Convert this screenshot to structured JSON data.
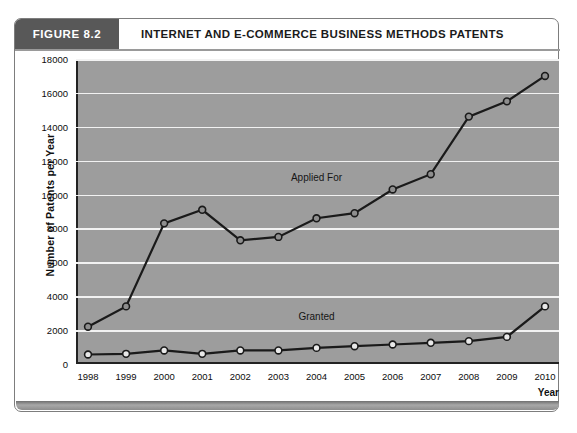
{
  "figure": {
    "tag": "FIGURE 8.2",
    "title": "INTERNET AND E-COMMERCE BUSINESS METHODS PATENTS"
  },
  "chart_data": {
    "type": "line",
    "title": "INTERNET AND E-COMMERCE BUSINESS METHODS PATENTS",
    "xlabel": "Year",
    "ylabel": "Number of Patents per Year",
    "categories": [
      "1998",
      "1999",
      "2000",
      "2001",
      "2002",
      "2003",
      "2004",
      "2005",
      "2006",
      "2007",
      "2008",
      "2009",
      "2010"
    ],
    "xlim": [
      1998,
      2010
    ],
    "ylim": [
      0,
      18000
    ],
    "yticks": [
      0,
      2000,
      4000,
      6000,
      8000,
      10000,
      12000,
      14000,
      16000,
      18000
    ],
    "ytick_labels": [
      "0",
      "2000",
      "4000",
      "6000",
      "8000",
      "10000",
      "12000",
      "14000",
      "16000",
      "18000"
    ],
    "grid": true,
    "legend": "inline-annotations",
    "plot_background": "#9d9d9d",
    "gridline_color": "#f2f2f2",
    "line_color": "#1a1a1a",
    "marker_face_applied": "#8e8e8e",
    "marker_face_granted": "#e8e8e8",
    "series": [
      {
        "name": "Applied For",
        "label_x_category": "2004",
        "label_y_value": 10900,
        "values": [
          2200,
          3400,
          8300,
          9100,
          7300,
          7500,
          8600,
          8900,
          10300,
          11200,
          14600,
          15500,
          17000
        ]
      },
      {
        "name": "Granted",
        "label_x_category": "2004",
        "label_y_value": 2700,
        "values": [
          560,
          600,
          800,
          600,
          800,
          800,
          950,
          1050,
          1150,
          1250,
          1350,
          1600,
          3400
        ]
      }
    ]
  }
}
